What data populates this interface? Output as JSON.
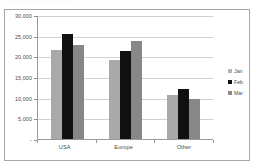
{
  "caption": {
    "text": "................ ............ ............"
  },
  "legend": {
    "position": "right",
    "items": [
      {
        "label": "Jan",
        "color": "#b4b4b4"
      },
      {
        "label": "Feb",
        "color": "#111111"
      },
      {
        "label": "Mar",
        "color": "#8a8a8a"
      }
    ]
  },
  "axes": {
    "y_ticks": [
      "30,000",
      "25,000",
      "20,000",
      "15,000",
      "10,000",
      "5,000",
      "-"
    ],
    "x_ticks": [
      "USA",
      "Europe",
      "Other"
    ]
  },
  "chart_data": {
    "type": "bar",
    "title": "",
    "xlabel": "",
    "ylabel": "",
    "categories": [
      "USA",
      "Europe",
      "Other"
    ],
    "series": [
      {
        "name": "Jan",
        "color": "#a9a9a9",
        "values": [
          21600,
          19200,
          10700
        ]
      },
      {
        "name": "Feb",
        "color": "#111111",
        "values": [
          25300,
          21400,
          12200
        ]
      },
      {
        "name": "Mar",
        "color": "#878787",
        "values": [
          22800,
          23600,
          9600
        ]
      }
    ],
    "ylim": [
      0,
      30000
    ],
    "ytick_values": [
      0,
      5000,
      10000,
      15000,
      20000,
      25000,
      30000
    ],
    "ytick_labels": [
      "-",
      "5,000",
      "10,000",
      "15,000",
      "20,000",
      "25,000",
      "30,000"
    ],
    "grid": true,
    "grid_axis": "y",
    "legend_position": "right"
  }
}
